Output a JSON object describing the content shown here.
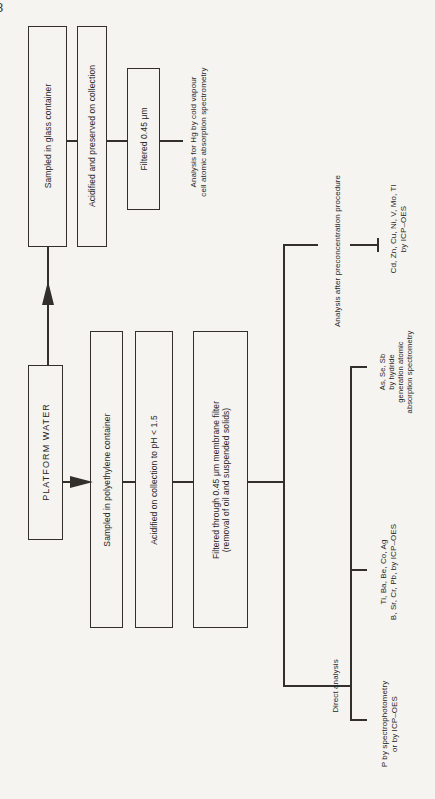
{
  "page": {
    "corner_label": "8",
    "colors": {
      "background": "#f5f4f0",
      "line": "#33302b",
      "text": "#28251f"
    }
  },
  "flow": {
    "source_box": "PLATFORM WATER",
    "glass_branch": {
      "box_sampled": "Sampled in glass container",
      "box_acidified": "Acidified and preserved on collection",
      "box_filtered": "Filtered 0.45 μm",
      "result_hg": {
        "line1": "Analysis for Hg by cold vapour",
        "line2": "cell atomic absorption spectrometry"
      }
    },
    "polyethylene_branch": {
      "box_sampled": "Sampled in polyethylene container",
      "box_acidified": "Acidified on collection to pH < 1.5",
      "box_filtered": {
        "line1": "Filtered through 0.45 μm membrane filter",
        "line2": "(removal of oil and suspended solids)"
      }
    },
    "preconcentration": {
      "label": "Analysis after preconcentration procedure",
      "result": {
        "line1": "Cd, Zn, Cu, Ni, V, Mo, Tl",
        "line2": "by ICP–OES"
      }
    },
    "direct": {
      "label": "Direct analysis",
      "result_hydride": {
        "line1": "As, Se, Sb",
        "line2": "by hydride",
        "line3": "generation atomic",
        "line4": "absorption spectrometry"
      },
      "result_icp": {
        "line1": "Ti, Ba, Be, Co, Ag",
        "line2": "B, Sr, Cr, Pb, by ICP–OES"
      },
      "result_p": {
        "line1": "P by spectrophotometry",
        "line2": "or by ICP–OES"
      }
    }
  }
}
